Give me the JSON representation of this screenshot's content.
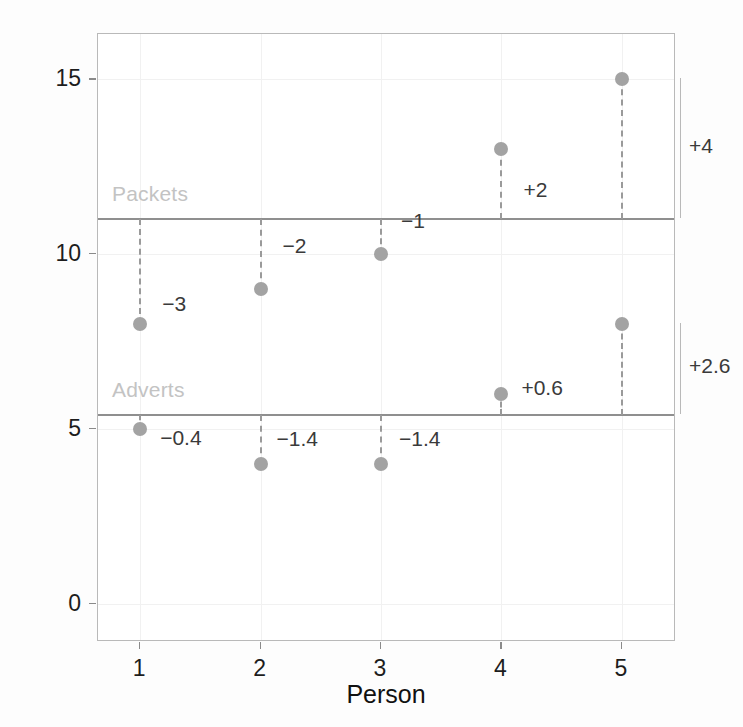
{
  "chart_data": {
    "type": "scatter",
    "title": "",
    "xlabel": "Person",
    "ylabel": "Number of Adverts/Packets",
    "categories": [
      "1",
      "2",
      "3",
      "4",
      "5"
    ],
    "x": [
      1,
      2,
      3,
      4,
      5
    ],
    "xlim": [
      0.65,
      5.45
    ],
    "ylim": [
      -1.1,
      16.3
    ],
    "grid": true,
    "legend": "none",
    "yticks": [
      "0",
      "5",
      "10",
      "15"
    ],
    "ytick_values": [
      0,
      5,
      10,
      15
    ],
    "xticks": [
      "1",
      "2",
      "3",
      "4",
      "5"
    ],
    "series": [
      {
        "name": "Packets",
        "values": [
          8,
          9,
          10,
          13,
          15
        ],
        "mean": 11,
        "mean_label": "Packets",
        "deviations": [
          "−3",
          "−2",
          "−1",
          "+2",
          "+4"
        ],
        "deviation_values": [
          -3,
          -2,
          -1,
          2,
          4
        ]
      },
      {
        "name": "Adverts",
        "values": [
          5,
          4,
          4,
          6,
          8
        ],
        "mean": 5.4,
        "mean_label": "Adverts",
        "deviations": [
          "−0.4",
          "−1.4",
          "−1.4",
          "+0.6",
          "+2.6"
        ],
        "deviation_values": [
          -0.4,
          -1.4,
          -1.4,
          0.6,
          2.6
        ]
      }
    ],
    "colors": {
      "point": "#a3a3a3",
      "mean_line": "#8f8f8f",
      "mean_label": "#c3c3c3",
      "dashed": "#9a9a9a",
      "text": "#1d1d1d",
      "frame": "#b9b9b9",
      "grid": "#f1f1f1",
      "background": "#ffffff"
    }
  }
}
